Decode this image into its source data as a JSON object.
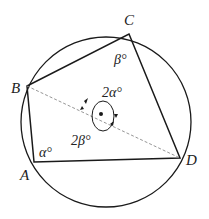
{
  "diagram": {
    "points": {
      "A": {
        "label": "A",
        "x": 34,
        "y": 162
      },
      "B": {
        "label": "B",
        "x": 27,
        "y": 86
      },
      "C": {
        "label": "C",
        "x": 129,
        "y": 34
      },
      "D": {
        "label": "D",
        "x": 180,
        "y": 158
      }
    },
    "circle": {
      "cx": 106,
      "cy": 122,
      "r": 85
    },
    "center": {
      "x": 101,
      "y": 114
    },
    "angles": {
      "at_A": "α°",
      "at_C": "β°",
      "central_upper": "2α°",
      "central_lower": "2β°"
    },
    "diagonal": "BD (dashed)",
    "colors": {
      "stroke": "#1a1a1a",
      "dashed": "#8a8a8a",
      "text": "#222222"
    }
  }
}
